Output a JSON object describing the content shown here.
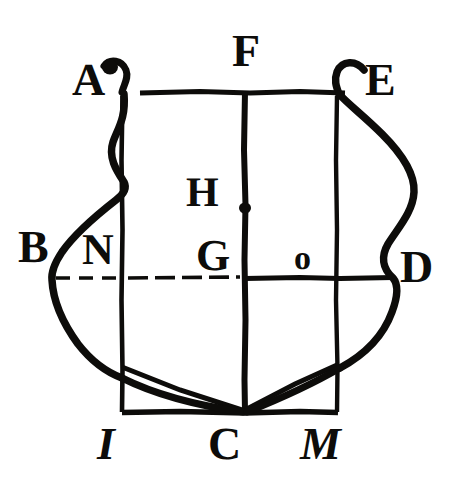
{
  "figure": {
    "kind": "geometric-construction-diagram",
    "background_color": "#ffffff",
    "ink_color": "#0d0c0a",
    "canvas": {
      "width": 459,
      "height": 485
    },
    "labels": [
      {
        "id": "A",
        "text": "A",
        "x": 72,
        "y": 57,
        "size": 46,
        "italic": false,
        "role": "upper-left-corner"
      },
      {
        "id": "F",
        "text": "F",
        "x": 232,
        "y": 28,
        "size": 46,
        "italic": false,
        "role": "top-center"
      },
      {
        "id": "E",
        "text": "E",
        "x": 365,
        "y": 57,
        "size": 46,
        "italic": false,
        "role": "upper-right-corner"
      },
      {
        "id": "H",
        "text": "H",
        "x": 186,
        "y": 172,
        "size": 42,
        "italic": false,
        "role": "inner-upper-center"
      },
      {
        "id": "B",
        "text": "B",
        "x": 18,
        "y": 224,
        "size": 46,
        "italic": false,
        "role": "left-flank"
      },
      {
        "id": "N",
        "text": "N",
        "x": 82,
        "y": 228,
        "size": 44,
        "italic": false,
        "role": "left-fess-point"
      },
      {
        "id": "G",
        "text": "G",
        "x": 196,
        "y": 234,
        "size": 44,
        "italic": false,
        "role": "center-fess-point"
      },
      {
        "id": "O",
        "text": "o",
        "x": 294,
        "y": 242,
        "size": 34,
        "italic": false,
        "role": "right-fess-point"
      },
      {
        "id": "D",
        "text": "D",
        "x": 400,
        "y": 244,
        "size": 46,
        "italic": false,
        "role": "right-flank"
      },
      {
        "id": "I",
        "text": "I",
        "x": 97,
        "y": 421,
        "size": 46,
        "italic": true,
        "role": "bottom-left"
      },
      {
        "id": "C",
        "text": "C",
        "x": 208,
        "y": 421,
        "size": 46,
        "italic": false,
        "role": "bottom-point"
      },
      {
        "id": "M",
        "text": "M",
        "x": 300,
        "y": 421,
        "size": 46,
        "italic": true,
        "role": "bottom-right"
      }
    ],
    "points": [
      {
        "id": "A",
        "x": 122,
        "y": 92,
        "desc": "top-left of chief line"
      },
      {
        "id": "F",
        "x": 245,
        "y": 92,
        "desc": "midpoint of chief line"
      },
      {
        "id": "E",
        "x": 337,
        "y": 92,
        "desc": "top-right of chief line"
      },
      {
        "id": "H",
        "x": 245,
        "y": 208,
        "desc": "honour point on palar line"
      },
      {
        "id": "B",
        "x": 52,
        "y": 278,
        "desc": "left end of fess line"
      },
      {
        "id": "N",
        "x": 122,
        "y": 278,
        "desc": "fess line crosses left vertical"
      },
      {
        "id": "G",
        "x": 245,
        "y": 278,
        "desc": "fess point, centre of shield"
      },
      {
        "id": "O",
        "x": 310,
        "y": 278,
        "desc": "right-of-centre point on fess line"
      },
      {
        "id": "D",
        "x": 395,
        "y": 278,
        "desc": "right end of fess line"
      },
      {
        "id": "I",
        "x": 122,
        "y": 412,
        "desc": "bottom-left corner of base rectangle"
      },
      {
        "id": "C",
        "x": 245,
        "y": 412,
        "desc": "base point of shield"
      },
      {
        "id": "M",
        "x": 337,
        "y": 412,
        "desc": "bottom-right corner of base rectangle"
      }
    ],
    "construction_lines": [
      {
        "name": "chief-line-AE",
        "from": "A",
        "to": "E",
        "style": "solid",
        "orientation": "horizontal"
      },
      {
        "name": "fess-line-BD",
        "from": "B",
        "to": "D",
        "style": "broken",
        "orientation": "horizontal"
      },
      {
        "name": "base-line-IM",
        "from": "I",
        "to": "M",
        "style": "solid",
        "orientation": "horizontal"
      },
      {
        "name": "palar-line-FC",
        "from": "F",
        "to": "C",
        "style": "solid",
        "orientation": "vertical"
      },
      {
        "name": "left-vertical-AI",
        "from": "A",
        "to": "I",
        "style": "solid",
        "orientation": "vertical"
      },
      {
        "name": "right-vertical-EM",
        "from": "E",
        "to": "M",
        "style": "solid",
        "orientation": "vertical"
      },
      {
        "name": "diagonal-left-to-C",
        "from": "(122,367)",
        "to": "C",
        "style": "solid",
        "orientation": "diagonal"
      },
      {
        "name": "diagonal-right-to-C",
        "from": "(337,365)",
        "to": "C",
        "style": "solid",
        "orientation": "diagonal"
      }
    ],
    "shield_outline": {
      "name": "escutcheon-outline",
      "description": "Heavy curved outline: volute hooks at A and E, ogee flanks bulging outward past B and D, sweeping to the base point C.",
      "stroke_width": 7
    }
  }
}
